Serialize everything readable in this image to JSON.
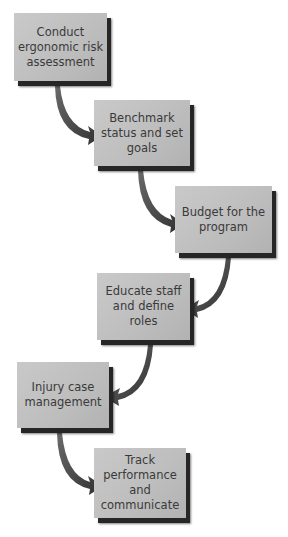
{
  "diagram": {
    "type": "flowchart",
    "steps": [
      {
        "label": "Conduct ergonomic risk assessment"
      },
      {
        "label": "Benchmark status and set goals"
      },
      {
        "label": "Budget for the program"
      },
      {
        "label": "Educate staff and define roles"
      },
      {
        "label": "Injury case management"
      },
      {
        "label": "Track performance and communicate"
      }
    ],
    "colors": {
      "box_fill": "#c0c0c0",
      "box_shadow": "#262626",
      "arrow": "#4a4a4a",
      "text": "#3a3a3a"
    }
  }
}
